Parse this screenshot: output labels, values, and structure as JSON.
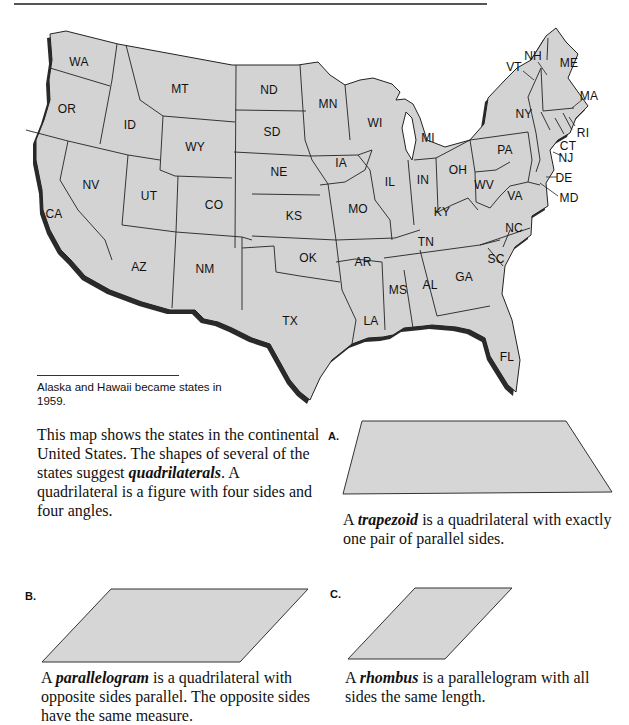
{
  "page": {
    "caption": "Alaska and Hawaii became states in 1959.",
    "intro": {
      "part1": "This map shows the states in the continental United States. The shapes of several of the states suggest ",
      "term": "quadrilaterals",
      "part2": ". A quadrilateral is a figure with four sides and four angles."
    }
  },
  "map": {
    "fill_color": "#d3d3d3",
    "border_color": "#222222",
    "shadow_color": "#2a2a2a",
    "states": [
      {
        "abbr": "WA",
        "x": 79,
        "y": 62
      },
      {
        "abbr": "OR",
        "x": 67,
        "y": 109
      },
      {
        "abbr": "CA",
        "x": 54,
        "y": 214
      },
      {
        "abbr": "ID",
        "x": 130,
        "y": 125
      },
      {
        "abbr": "NV",
        "x": 91,
        "y": 185
      },
      {
        "abbr": "MT",
        "x": 180,
        "y": 89
      },
      {
        "abbr": "WY",
        "x": 195,
        "y": 147
      },
      {
        "abbr": "UT",
        "x": 149,
        "y": 196
      },
      {
        "abbr": "CO",
        "x": 214,
        "y": 205
      },
      {
        "abbr": "AZ",
        "x": 139,
        "y": 267
      },
      {
        "abbr": "NM",
        "x": 205,
        "y": 269
      },
      {
        "abbr": "ND",
        "x": 269,
        "y": 90
      },
      {
        "abbr": "SD",
        "x": 272,
        "y": 132
      },
      {
        "abbr": "NE",
        "x": 279,
        "y": 172
      },
      {
        "abbr": "KS",
        "x": 294,
        "y": 216
      },
      {
        "abbr": "OK",
        "x": 308,
        "y": 258
      },
      {
        "abbr": "TX",
        "x": 290,
        "y": 321
      },
      {
        "abbr": "MN",
        "x": 328,
        "y": 104
      },
      {
        "abbr": "IA",
        "x": 341,
        "y": 163
      },
      {
        "abbr": "MO",
        "x": 358,
        "y": 209
      },
      {
        "abbr": "AR",
        "x": 363,
        "y": 262
      },
      {
        "abbr": "LA",
        "x": 371,
        "y": 321
      },
      {
        "abbr": "WI",
        "x": 375,
        "y": 123
      },
      {
        "abbr": "IL",
        "x": 390,
        "y": 182
      },
      {
        "abbr": "MI",
        "x": 428,
        "y": 138
      },
      {
        "abbr": "IN",
        "x": 423,
        "y": 180
      },
      {
        "abbr": "OH",
        "x": 458,
        "y": 170
      },
      {
        "abbr": "KY",
        "x": 442,
        "y": 212
      },
      {
        "abbr": "TN",
        "x": 426,
        "y": 242
      },
      {
        "abbr": "MS",
        "x": 398,
        "y": 290
      },
      {
        "abbr": "AL",
        "x": 430,
        "y": 285
      },
      {
        "abbr": "GA",
        "x": 464,
        "y": 277
      },
      {
        "abbr": "FL",
        "x": 507,
        "y": 357
      },
      {
        "abbr": "SC",
        "x": 496,
        "y": 259
      },
      {
        "abbr": "NC",
        "x": 514,
        "y": 228
      },
      {
        "abbr": "VA",
        "x": 515,
        "y": 196
      },
      {
        "abbr": "WV",
        "x": 484,
        "y": 185
      },
      {
        "abbr": "PA",
        "x": 505,
        "y": 150
      },
      {
        "abbr": "NY",
        "x": 524,
        "y": 114
      },
      {
        "abbr": "ME",
        "x": 569,
        "y": 63
      },
      {
        "abbr": "NH",
        "x": 533,
        "y": 56
      },
      {
        "abbr": "VT",
        "x": 514,
        "y": 67
      },
      {
        "abbr": "MA",
        "x": 589,
        "y": 96
      },
      {
        "abbr": "RI",
        "x": 583,
        "y": 133
      },
      {
        "abbr": "CT",
        "x": 568,
        "y": 146
      },
      {
        "abbr": "NJ",
        "x": 566,
        "y": 158
      },
      {
        "abbr": "DE",
        "x": 564,
        "y": 178
      },
      {
        "abbr": "MD",
        "x": 569,
        "y": 198
      }
    ]
  },
  "figures": {
    "fill_color": "#d6d6d6",
    "a": {
      "letter": "A.",
      "desc_pre": "A ",
      "term": "trapezoid",
      "desc_post": " is a quadrilateral with exactly one pair of parallel sides."
    },
    "b": {
      "letter": "B.",
      "desc_pre": "A ",
      "term": "parallelogram",
      "desc_post": " is a quadrilateral with opposite sides parallel. The opposite sides have the same measure."
    },
    "c": {
      "letter": "C.",
      "desc_pre": "A ",
      "term": "rhombus",
      "desc_post": " is a parallelogram with all sides the same length."
    }
  }
}
